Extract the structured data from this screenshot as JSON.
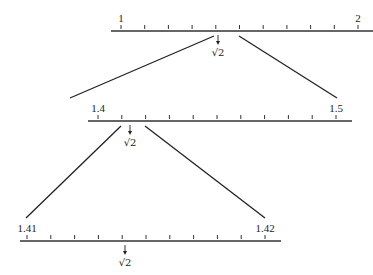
{
  "diagram": {
    "levels": [
      {
        "name": "level-1",
        "start_label": "1",
        "end_label": "2",
        "marker_label": "√2",
        "ticks": 11,
        "axis": {
          "x1": 111,
          "x2": 373,
          "y": 31
        },
        "tick_start_x": 121,
        "tick_end_x": 358,
        "marker_x": 218
      },
      {
        "name": "level-2",
        "start_label": "1.4",
        "end_label": "1.5",
        "marker_label": "√2",
        "ticks": 11,
        "axis": {
          "x1": 88,
          "x2": 352,
          "y": 121
        },
        "tick_start_x": 98,
        "tick_end_x": 336,
        "marker_x": 130
      },
      {
        "name": "level-3",
        "start_label": "1.41",
        "end_label": "1.42",
        "marker_label": "√2",
        "ticks": 11,
        "axis": {
          "x1": 20,
          "x2": 281,
          "y": 241
        },
        "tick_start_x": 27,
        "tick_end_x": 265,
        "marker_x": 125
      }
    ],
    "connectors": [
      {
        "x1": 214,
        "y1": 36,
        "x2": 70,
        "y2": 98
      },
      {
        "x1": 239,
        "y1": 36,
        "x2": 337,
        "y2": 98
      },
      {
        "x1": 121,
        "y1": 126,
        "x2": 26,
        "y2": 218
      },
      {
        "x1": 145,
        "y1": 126,
        "x2": 265,
        "y2": 218
      }
    ],
    "colors": {
      "ink": "#222222",
      "background": "#ffffff"
    }
  }
}
